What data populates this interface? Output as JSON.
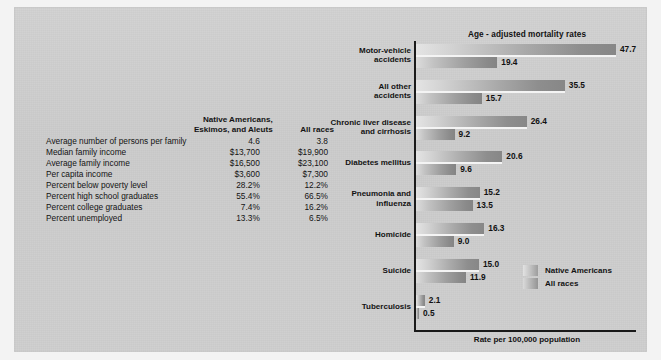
{
  "figure": {
    "background_color": "#cfcfcf"
  },
  "table": {
    "headers": {
      "blank": "",
      "col1_line1": "Native Americans,",
      "col1_line2": "Eskimos, and Aleuts",
      "col2": "All races"
    },
    "rows": [
      {
        "label": "Average number of persons per family",
        "native": "4.6",
        "all": "3.8"
      },
      {
        "label": "Median family income",
        "native": "$13,700",
        "all": "$19,900"
      },
      {
        "label": "Average family income",
        "native": "$16,500",
        "all": "$23,100"
      },
      {
        "label": "Per capita income",
        "native": "$3,600",
        "all": "$7,300"
      },
      {
        "label": "Percent below poverty level",
        "native": "28.2%",
        "all": "12.2%"
      },
      {
        "label": "Percent high school graduates",
        "native": "55.4%",
        "all": "66.5%"
      },
      {
        "label": "Percent college graduates",
        "native": "7.4%",
        "all": "16.2%"
      },
      {
        "label": "Percent unemployed",
        "native": "13.3%",
        "all": "6.5%"
      }
    ]
  },
  "chart_data": {
    "type": "bar",
    "orientation": "horizontal",
    "title": "Age - adjusted mortality rates",
    "xlabel": "Rate per 100,000 population",
    "ylabel": "",
    "xlim": [
      0,
      52
    ],
    "grid": false,
    "legend_position": "inside-right-lower",
    "categories": [
      "Motor-vehicle accidents",
      "All other accidents",
      "Chronic liver disease and cirrhosis",
      "Diabetes mellitus",
      "Pneumonia and influenza",
      "Homicide",
      "Suicide",
      "Tuberculosis"
    ],
    "category_lines": [
      [
        "Motor-vehicle",
        "accidents"
      ],
      [
        "All other",
        "accidents"
      ],
      [
        "Chronic liver disease",
        "and cirrhosis"
      ],
      [
        "Diabetes mellitus"
      ],
      [
        "Pneumonia and",
        "influenza"
      ],
      [
        "Homicide"
      ],
      [
        "Suicide"
      ],
      [
        "Tuberculosis"
      ]
    ],
    "series": [
      {
        "name": "Native Americans",
        "values": [
          47.7,
          35.5,
          26.4,
          20.6,
          15.2,
          16.3,
          15.0,
          2.1
        ],
        "labels": [
          "47.7",
          "35.5",
          "26.4",
          "20.6",
          "15.2",
          "16.3",
          "15.0",
          "2.1"
        ]
      },
      {
        "name": "All races",
        "values": [
          19.4,
          15.7,
          9.2,
          9.6,
          13.5,
          9.0,
          11.9,
          0.5
        ],
        "labels": [
          "19.4",
          "15.7",
          "9.2",
          "9.6",
          "13.5",
          "9.0",
          "11.9",
          "0.5"
        ]
      }
    ],
    "legend": [
      "Native Americans",
      "All races"
    ]
  }
}
